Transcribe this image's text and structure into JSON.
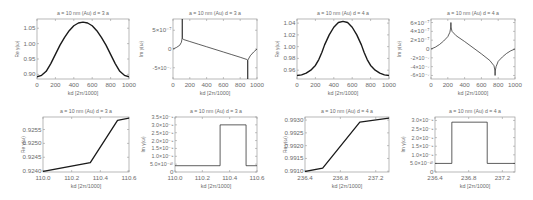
{
  "chart_data": [
    {
      "id": "p1",
      "type": "line",
      "title": "a = 10 nm (Au) d = 3 a",
      "xlabel": "kd [2π/1000]",
      "ylabel": "Re γ(ω)",
      "xlim": [
        0,
        1000
      ],
      "ylim": [
        0.885,
        1.08
      ],
      "xticks": [
        0,
        200,
        400,
        600,
        800,
        1000
      ],
      "xticklabels": [
        "0",
        "200",
        "400",
        "600",
        "800",
        "1000"
      ],
      "yticks": [
        0.9,
        0.95,
        1.0,
        1.05
      ],
      "yticklabels": [
        "0.90",
        "0.95",
        "1.00",
        "1.05"
      ],
      "x": [
        0,
        50,
        100,
        150,
        200,
        250,
        300,
        350,
        400,
        450,
        500,
        550,
        600,
        650,
        700,
        750,
        800,
        850,
        900,
        950,
        1000
      ],
      "y": [
        0.892,
        0.897,
        0.91,
        0.935,
        0.965,
        0.995,
        1.02,
        1.042,
        1.058,
        1.067,
        1.07,
        1.067,
        1.058,
        1.042,
        1.02,
        0.995,
        0.965,
        0.935,
        0.91,
        0.897,
        0.892
      ],
      "frame": {
        "x": 37,
        "y": 19,
        "w": 92,
        "h": 60
      }
    },
    {
      "id": "p2",
      "type": "line",
      "title": "a = 10 nm (Au) d = 3 a",
      "xlabel": "kd [2π/1000]",
      "ylabel": "Im γ(ω)",
      "xlim": [
        0,
        1000
      ],
      "ylim": [
        -8e-07,
        8e-07
      ],
      "xticks": [
        0,
        200,
        400,
        600,
        800,
        1000
      ],
      "xticklabels": [
        "0",
        "200",
        "400",
        "600",
        "800",
        "1000"
      ],
      "yticks": [
        5e-07,
        0,
        -5e-07
      ],
      "yticklabels": [
        "5×10⁻⁷",
        "0",
        "-5×10⁻⁷"
      ],
      "x": [
        0,
        40,
        80,
        100,
        110,
        110.5,
        111,
        130,
        200,
        300,
        400,
        500,
        600,
        700,
        800,
        880,
        889,
        889.5,
        890,
        920,
        960,
        1000
      ],
      "y": [
        0,
        4e-08,
        1e-07,
        1.8e-07,
        3e-07,
        8e-07,
        2.8e-07,
        2.5e-07,
        2e-07,
        1.3e-07,
        6e-08,
        -1e-08,
        -8e-08,
        -1.5e-07,
        -2.2e-07,
        -2.8e-07,
        -3e-07,
        -8e-07,
        -3e-07,
        -1.8e-07,
        -8e-08,
        0
      ],
      "frame": {
        "x": 173,
        "y": 19,
        "w": 84,
        "h": 60
      }
    },
    {
      "id": "p3",
      "type": "line",
      "title": "a = 10 nm (Au) d = 4 a",
      "xlabel": "kd [2π/1000]",
      "ylabel": "Re γ(ω)",
      "xlim": [
        0,
        1000
      ],
      "ylim": [
        0.945,
        1.047
      ],
      "xticks": [
        0,
        200,
        400,
        600,
        800,
        1000
      ],
      "xticklabels": [
        "0",
        "200",
        "400",
        "600",
        "800",
        "1000"
      ],
      "yticks": [
        0.96,
        0.98,
        1.0,
        1.02,
        1.04
      ],
      "yticklabels": [
        "0.96",
        "0.98",
        "1.00",
        "1.02",
        "1.04"
      ],
      "x": [
        0,
        50,
        100,
        150,
        200,
        237,
        270,
        300,
        350,
        400,
        450,
        500,
        550,
        600,
        650,
        700,
        730,
        763,
        800,
        850,
        900,
        950,
        1000
      ],
      "y": [
        0.951,
        0.952,
        0.955,
        0.96,
        0.968,
        0.978,
        0.99,
        1.003,
        1.02,
        1.033,
        1.041,
        1.043,
        1.041,
        1.033,
        1.02,
        1.003,
        0.99,
        0.978,
        0.968,
        0.96,
        0.955,
        0.952,
        0.951
      ],
      "frame": {
        "x": 297,
        "y": 19,
        "w": 92,
        "h": 60
      }
    },
    {
      "id": "p4",
      "type": "line",
      "title": "a = 10 nm (Au) d = 4 a",
      "xlabel": "kd [2π/1000]",
      "ylabel": "Im γ(ω)",
      "xlim": [
        0,
        1000
      ],
      "ylim": [
        -6.8e-07,
        6.8e-07
      ],
      "xticks": [
        0,
        200,
        400,
        600,
        800,
        1000
      ],
      "xticklabels": [
        "0",
        "200",
        "400",
        "600",
        "800",
        "1000"
      ],
      "yticks": [
        6e-07,
        4e-07,
        2e-07,
        0,
        -2e-07,
        -4e-07,
        -6e-07
      ],
      "yticklabels": [
        "6×10⁻⁷",
        "4×10⁻⁷",
        "2×10⁻⁷",
        "0",
        "-2×10⁻⁷",
        "-4×10⁻⁷",
        "-6×10⁻⁷"
      ],
      "x": [
        0,
        50,
        100,
        150,
        200,
        225,
        236,
        237,
        238,
        250,
        300,
        400,
        500,
        600,
        700,
        750,
        762,
        763,
        764,
        775,
        800,
        850,
        900,
        950,
        1000
      ],
      "y": [
        0,
        4e-08,
        1e-07,
        1.8e-07,
        2.8e-07,
        3.8e-07,
        5e-07,
        6e-07,
        5e-07,
        4e-07,
        3e-07,
        1.7e-07,
        3e-08,
        -1.1e-07,
        -2.6e-07,
        -3.8e-07,
        -5e-07,
        -6e-07,
        -5e-07,
        -4e-07,
        -2.8e-07,
        -1.8e-07,
        -1e-07,
        -4e-08,
        0
      ],
      "frame": {
        "x": 431,
        "y": 19,
        "w": 84,
        "h": 60
      }
    },
    {
      "id": "p5",
      "type": "line",
      "title": "a = 10 nm (Au) d = 3 a",
      "xlabel": "kd [2π/1000]",
      "ylabel": "Re γ(ω)",
      "xlim": [
        110.0,
        110.6
      ],
      "ylim": [
        0.92397,
        0.92595
      ],
      "xticks": [
        110.0,
        110.2,
        110.4,
        110.6
      ],
      "xticklabels": [
        "110.0",
        "110.2",
        "110.4",
        "110.6"
      ],
      "yticks": [
        0.924,
        0.9245,
        0.925,
        0.9255
      ],
      "yticklabels": [
        "0.9240",
        "0.9245",
        "0.9250",
        "0.9255"
      ],
      "x": [
        110.0,
        110.33,
        110.52,
        110.6
      ],
      "y": [
        0.92399,
        0.92431,
        0.92583,
        0.92591
      ],
      "frame": {
        "x": 43,
        "y": 117,
        "w": 86,
        "h": 55
      }
    },
    {
      "id": "p6",
      "type": "line",
      "title": "a = 10 nm (Au) d = 3 a",
      "xlabel": "kd [2π/1000]",
      "ylabel": "Im γ(ω)",
      "xlim": [
        110.0,
        110.6
      ],
      "ylim": [
        0,
        3.5e-09
      ],
      "xticks": [
        110.0,
        110.2,
        110.4,
        110.6
      ],
      "xticklabels": [
        "110.0",
        "110.2",
        "110.4",
        "110.6"
      ],
      "yticks": [
        0,
        5e-10,
        1e-09,
        1.5e-09,
        2e-09,
        2.5e-09,
        3e-09,
        3.5e-09
      ],
      "yticklabels": [
        "0",
        "5.0×10⁻¹⁰",
        "1.0×10⁻⁹",
        "1.5×10⁻⁹",
        "2.0×10⁻⁹",
        "2.5×10⁻⁹",
        "3.0×10⁻⁹",
        "3.5×10⁻⁹"
      ],
      "x": [
        110.0,
        110.33,
        110.33,
        110.52,
        110.52,
        110.6
      ],
      "y": [
        4e-10,
        4e-10,
        3e-09,
        3e-09,
        4e-10,
        4e-10
      ],
      "frame": {
        "x": 175,
        "y": 117,
        "w": 82,
        "h": 55
      }
    },
    {
      "id": "p7",
      "type": "line",
      "title": "a = 10 nm (Au) d = 4 a",
      "xlabel": "kd [2π/1000]",
      "ylabel": "Re γ(ω)",
      "xlim": [
        236.4,
        237.35
      ],
      "ylim": [
        0.99097,
        0.99312
      ],
      "xticks": [
        236.4,
        236.8,
        237.2
      ],
      "xticklabels": [
        "236.4",
        "236.8",
        "237.2"
      ],
      "yticks": [
        0.991,
        0.9915,
        0.992,
        0.9925,
        0.993
      ],
      "yticklabels": [
        "0.9910",
        "0.9915",
        "0.9920",
        "0.9925",
        "0.9930"
      ],
      "x": [
        236.4,
        236.6,
        237.02,
        237.35
      ],
      "y": [
        0.99099,
        0.99112,
        0.99292,
        0.99308
      ],
      "frame": {
        "x": 305,
        "y": 117,
        "w": 84,
        "h": 55
      }
    },
    {
      "id": "p8",
      "type": "line",
      "title": "a = 10 nm (Au) d = 4 a",
      "xlabel": "kd [2π/1000]",
      "ylabel": "Im γ(ω)",
      "xlim": [
        236.4,
        237.35
      ],
      "ylim": [
        0,
        3.2e-09
      ],
      "xticks": [
        236.4,
        236.8,
        237.2
      ],
      "xticklabels": [
        "236.4",
        "236.8",
        "237.2"
      ],
      "yticks": [
        0,
        5e-10,
        1e-09,
        1.5e-09,
        2e-09,
        2.5e-09,
        3e-09
      ],
      "yticklabels": [
        "0",
        "5.0×10⁻¹⁰",
        "1.0×10⁻⁹",
        "1.5×10⁻⁹",
        "2.0×10⁻⁹",
        "2.5×10⁻⁹",
        "3.0×10⁻⁹"
      ],
      "x": [
        236.4,
        236.6,
        236.6,
        237.02,
        237.02,
        237.35
      ],
      "y": [
        5e-10,
        5e-10,
        2.9e-09,
        2.9e-09,
        5e-10,
        5e-10
      ],
      "frame": {
        "x": 435,
        "y": 117,
        "w": 80,
        "h": 55
      }
    }
  ],
  "style": {
    "line_color": "#1a1a1a",
    "frame_color": "#9a9a9a",
    "text_color": "#6b6b6b",
    "background": "#ffffff"
  }
}
